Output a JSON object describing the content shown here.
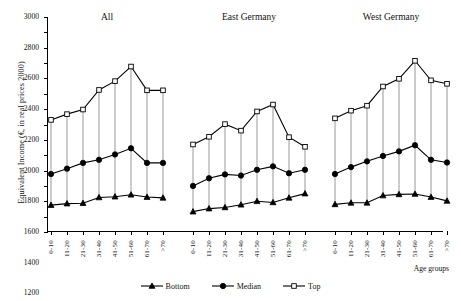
{
  "chart_data": {
    "type": "line",
    "title": "",
    "ylabel": "Equivalent Income (€, in real prices 2000)",
    "xlabel": "Age groups",
    "ylim": [
      200,
      3000
    ],
    "ytick_step": 200,
    "yticks": [
      200,
      400,
      600,
      800,
      1000,
      1200,
      1400,
      1600,
      1800,
      2000,
      2200,
      2400,
      2600,
      2800,
      3000
    ],
    "grid": false,
    "legend_position": "bottom-center",
    "categories": [
      "0-10",
      "11-20",
      "21-30",
      "31-40",
      "41-50",
      "51-60",
      "61-70",
      ">70"
    ],
    "panels": [
      {
        "title": "All",
        "series": [
          {
            "name": "Bottom",
            "marker": "triangle",
            "filled": true,
            "values": [
              550,
              570,
              575,
              650,
              660,
              685,
              655,
              645
            ]
          },
          {
            "name": "Median",
            "marker": "circle",
            "filled": true,
            "values": [
              955,
              1025,
              1100,
              1140,
              1210,
              1290,
              1100,
              1100
            ]
          },
          {
            "name": "Top",
            "marker": "square",
            "filled": false,
            "values": [
              1660,
              1735,
              1795,
              2050,
              2165,
              2355,
              2045,
              2045
            ]
          }
        ]
      },
      {
        "title": "East Germany",
        "series": [
          {
            "name": "Bottom",
            "marker": "triangle",
            "filled": true,
            "values": [
              465,
              505,
              520,
              555,
              600,
              585,
              645,
              700
            ]
          },
          {
            "name": "Median",
            "marker": "circle",
            "filled": true,
            "values": [
              800,
              900,
              950,
              935,
              1010,
              1055,
              965,
              1010
            ]
          },
          {
            "name": "Top",
            "marker": "square",
            "filled": false,
            "values": [
              1340,
              1440,
              1605,
              1520,
              1770,
              1860,
              1435,
              1310
            ]
          }
        ]
      },
      {
        "title": "West Germany",
        "series": [
          {
            "name": "Bottom",
            "marker": "triangle",
            "filled": true,
            "values": [
              560,
              580,
              580,
              675,
              690,
              695,
              655,
              605
            ]
          },
          {
            "name": "Median",
            "marker": "circle",
            "filled": true,
            "values": [
              955,
              1045,
              1120,
              1190,
              1250,
              1330,
              1140,
              1105
            ]
          },
          {
            "name": "Top",
            "marker": "square",
            "filled": false,
            "values": [
              1680,
              1780,
              1845,
              2095,
              2195,
              2430,
              2175,
              2130
            ]
          }
        ]
      }
    ],
    "legend": [
      {
        "label": "Bottom",
        "marker": "triangle",
        "filled": true
      },
      {
        "label": "Median",
        "marker": "circle",
        "filled": true
      },
      {
        "label": "Top",
        "marker": "square",
        "filled": false
      }
    ],
    "colors": {
      "line": "#000000",
      "connector": "#8c8c8c",
      "axis": "#000000",
      "background": "#ffffff"
    }
  }
}
